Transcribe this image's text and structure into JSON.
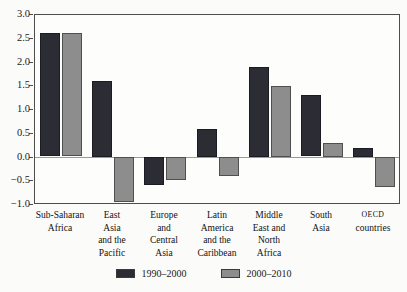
{
  "chart_data": {
    "type": "bar",
    "title": "",
    "xlabel": "",
    "ylabel": "",
    "ylim": [
      -1.0,
      3.0
    ],
    "y_tick_step": 0.5,
    "y_ticks": [
      "3.0",
      "2.5",
      "2.0",
      "1.5",
      "1.0",
      "0.5",
      "0.0",
      "−0.5",
      "−1.0"
    ],
    "y_tick_values": [
      3.0,
      2.5,
      2.0,
      1.5,
      1.0,
      0.5,
      0.0,
      -0.5,
      -1.0
    ],
    "grid": "zero-line-only",
    "legend_position": "bottom-center",
    "categories": [
      "Sub-Saharan Africa",
      "East Asia and the Pacific",
      "Europe and Central Asia",
      "Latin America and the Caribbean",
      "Middle East and North Africa",
      "South Asia",
      "OECD countries"
    ],
    "category_label_lines": [
      {
        "lines": [
          "Sub-Saharan",
          "Africa"
        ],
        "small_caps_first": false
      },
      {
        "lines": [
          "East",
          "Asia",
          "and the",
          "Pacific"
        ],
        "small_caps_first": false
      },
      {
        "lines": [
          "Europe",
          "and",
          "Central",
          "Asia"
        ],
        "small_caps_first": false
      },
      {
        "lines": [
          "Latin",
          "America",
          "and the",
          "Caribbean"
        ],
        "small_caps_first": false
      },
      {
        "lines": [
          "Middle",
          "East and",
          "North",
          "Africa"
        ],
        "small_caps_first": false
      },
      {
        "lines": [
          "South",
          "Asia"
        ],
        "small_caps_first": false
      },
      {
        "lines": [
          "OECD",
          "countries"
        ],
        "small_caps_first": true
      }
    ],
    "series": [
      {
        "name": "1990–2000",
        "color": "#2b2c34",
        "values": [
          2.6,
          1.6,
          -0.6,
          0.6,
          1.9,
          1.3,
          0.2
        ]
      },
      {
        "name": "2000–2010",
        "color": "#8d8d8d",
        "values": [
          2.6,
          -0.95,
          -0.5,
          -0.4,
          1.5,
          0.3,
          -0.65
        ]
      }
    ],
    "colors": {
      "series_1990_2000": "#2b2c34",
      "series_2000_2010": "#8d8d8d",
      "frame": "#4d4d4d",
      "zero_line": "#9a9a9a",
      "background": "#fbfbf9"
    }
  }
}
